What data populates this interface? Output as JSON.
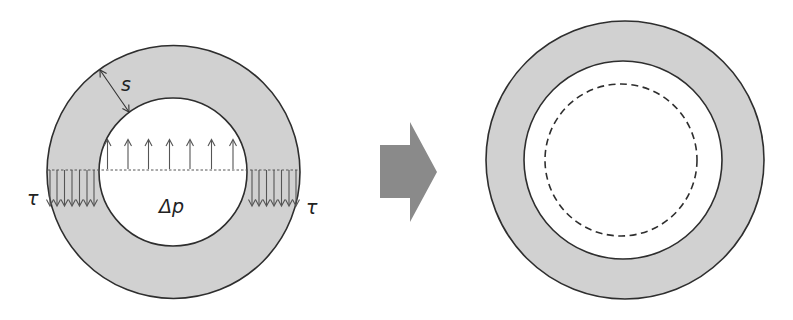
{
  "figure": {
    "colors": {
      "ring_fill": "#d1d1d1",
      "outline": "#2e2e2e",
      "transition_arrow": "#8a8a8a",
      "background": "#ffffff"
    },
    "left_panel": {
      "name": "loaded-pipe-section",
      "labels": {
        "wall_thickness": "s",
        "shear_left": "τ",
        "shear_right": "τ",
        "pressure": "Δp"
      },
      "pressure_arrow_count": 7,
      "shear_arrow_count_per_side": 7
    },
    "transition": {
      "name": "transition-arrow",
      "direction": "right"
    },
    "right_panel": {
      "name": "deformed-pipe-section",
      "inner_reference": "dashed circle (original bore)"
    }
  }
}
